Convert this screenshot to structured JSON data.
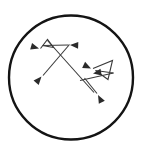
{
  "artwork": {
    "title": "Crossing arrows inside circle",
    "style": "line-drawing",
    "background_color": "#ffffff",
    "stroke_color": "#1a1a1a",
    "arrow_color": "#3a3a3a",
    "canvas": {
      "width": 154,
      "height": 156
    }
  },
  "circle": {
    "name": "outer-circle",
    "cx": 71,
    "cy": 77.5,
    "r": 62,
    "stroke_width": 2.4,
    "stroke_color": "#141414"
  },
  "shapes": {
    "stroke_width": 1.1,
    "left_cluster": {
      "label": "upper-left zigzag arrows",
      "polyline_points": "40.5,48.5 47.5,39.5 53.5,47.5 42.5,45.5",
      "segment_to_right": "42.5,45.5 68.5,45.0",
      "segment_diagonal_down": "53.5,47.5 44.0,74.0"
    },
    "long_diagonal": {
      "label": "long diagonal from upper right to lower left",
      "points": "69.5,44.5 43.0,75.5"
    },
    "cross_diagonal": {
      "label": "diagonal crossing to lower right",
      "points": "47.5,40.5 94.0,92.5"
    },
    "right_cluster": {
      "label": "lower-right zigzag arrows",
      "polyline_points": "93.0,68.5 112.5,60.5 108.0,79.5 95.5,70.5 113.5,73.0",
      "segment_left": "113.5,73.0 80.0,80.5",
      "segment_down": "84.5,78.0 97.0,93.5"
    },
    "arrowheads": [
      {
        "name": "arrowhead-left-upper",
        "tip_x": 39.0,
        "tip_y": 48.5,
        "angle_deg": 196
      },
      {
        "name": "arrowhead-right-upper",
        "tip_x": 70.0,
        "tip_y": 45.0,
        "angle_deg": 2
      },
      {
        "name": "arrowhead-down-left",
        "tip_x": 41.5,
        "tip_y": 76.5,
        "angle_deg": 131
      },
      {
        "name": "arrowhead-left-lower",
        "tip_x": 91.0,
        "tip_y": 68.5,
        "angle_deg": 206
      },
      {
        "name": "arrowhead-right-lower",
        "tip_x": 93.0,
        "tip_y": 73.5,
        "angle_deg": 350
      },
      {
        "name": "arrowhead-down-right",
        "tip_x": 98.0,
        "tip_y": 95.0,
        "angle_deg": 62
      }
    ]
  }
}
